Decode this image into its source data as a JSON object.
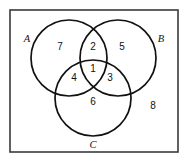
{
  "figure": {
    "frame": {
      "x": 10,
      "y": 10,
      "width": 168,
      "height": 142,
      "stroke_color": "#3a3a3a"
    },
    "stroke_color": "#111111",
    "background_color": "#ffffff"
  },
  "sets": [
    {
      "id": "A",
      "label": "A",
      "label_x": 27,
      "label_y": 38,
      "cx": 69,
      "cy": 58,
      "r": 38
    },
    {
      "id": "B",
      "label": "B",
      "label_x": 161,
      "label_y": 38,
      "cx": 118,
      "cy": 58,
      "r": 38
    },
    {
      "id": "C",
      "label": "C",
      "label_x": 93,
      "label_y": 144,
      "cx": 93,
      "cy": 98,
      "r": 38
    }
  ],
  "regions": [
    {
      "id": "r1",
      "label": "1",
      "x": 93,
      "y": 68,
      "sets": "A and B and C"
    },
    {
      "id": "r2",
      "label": "2",
      "x": 93,
      "y": 46,
      "sets": "A and B only"
    },
    {
      "id": "r3",
      "label": "3",
      "x": 110,
      "y": 77,
      "sets": "B and C only"
    },
    {
      "id": "r4",
      "label": "4",
      "x": 74,
      "y": 77,
      "sets": "A and C only"
    },
    {
      "id": "r5",
      "label": "5",
      "x": 122,
      "y": 46,
      "sets": "B only"
    },
    {
      "id": "r6",
      "label": "6",
      "x": 93,
      "y": 101,
      "sets": "C only"
    },
    {
      "id": "r7",
      "label": "7",
      "x": 60,
      "y": 46,
      "sets": "A only"
    },
    {
      "id": "r8",
      "label": "8",
      "x": 153,
      "y": 105,
      "sets": "outside all sets"
    }
  ]
}
